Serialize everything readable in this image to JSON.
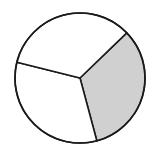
{
  "chart_data": {
    "type": "pie",
    "title": "",
    "categories": [
      "Shaded part",
      "Part 2",
      "Part 3"
    ],
    "values": [
      33.3,
      33.3,
      33.4
    ],
    "start_angles_deg": [
      46,
      165,
      284
    ],
    "colors": [
      "#d0d0d0",
      "#ffffff",
      "#ffffff"
    ],
    "shaded_fraction": "1/3",
    "legend": [],
    "annotations": []
  },
  "style": {
    "stroke_color": "#1a1a1a",
    "stroke_width": 1.6,
    "center": [
      80,
      78
    ],
    "radius": 65
  }
}
